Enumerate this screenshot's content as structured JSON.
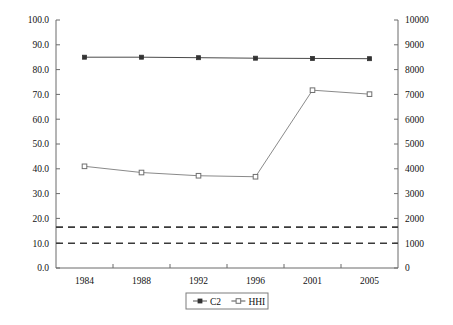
{
  "chart_data": {
    "type": "line",
    "title": "",
    "xlabel": "",
    "ylabel": "",
    "y2label": "",
    "categories": [
      "1984",
      "1988",
      "1992",
      "1996",
      "2001",
      "2005"
    ],
    "x": [
      1984,
      1988,
      1992,
      1996,
      2001,
      2005
    ],
    "ylim": [
      0.0,
      100.0
    ],
    "y2lim": [
      0,
      10000
    ],
    "ytick_labels": [
      "0.0",
      "10.0",
      "20.0",
      "30.0",
      "40.0",
      "50.0",
      "60.0",
      "70.0",
      "80.0",
      "90.0",
      "100.0"
    ],
    "ytick_values": [
      0.0,
      10.0,
      20.0,
      30.0,
      40.0,
      50.0,
      60.0,
      70.0,
      80.0,
      90.0,
      100.0
    ],
    "y2tick_labels": [
      "0",
      "1000",
      "2000",
      "3000",
      "4000",
      "5000",
      "6000",
      "7000",
      "8000",
      "9000",
      "10000"
    ],
    "y2tick_values": [
      0,
      1000,
      2000,
      3000,
      4000,
      5000,
      6000,
      7000,
      8000,
      9000,
      10000
    ],
    "grid": false,
    "legend_position": "bottom",
    "series": [
      {
        "name": "C2",
        "axis": "left",
        "marker": "filled-diamond",
        "color": "#4a4a4a",
        "values": [
          85.0,
          85.0,
          84.8,
          84.6,
          84.5,
          84.4
        ]
      },
      {
        "name": "HHI",
        "axis": "right",
        "marker": "open-square",
        "color": "#8a8a8a",
        "values": [
          41.0,
          38.5,
          37.2,
          36.8,
          71.7,
          70.1
        ],
        "values_right_axis": [
          4100,
          3850,
          3720,
          3680,
          7170,
          7010
        ]
      }
    ],
    "reference_lines": [
      {
        "name": "hhi-upper-threshold",
        "value": 16.5,
        "value_right_axis": 1650,
        "style": "dashed",
        "color": "#3a3a3a"
      },
      {
        "name": "hhi-lower-threshold",
        "value": 10.0,
        "value_right_axis": 1000,
        "style": "dashed",
        "color": "#3a3a3a"
      }
    ],
    "legend": [
      {
        "label": "C2",
        "marker": "filled-diamond"
      },
      {
        "label": "HHI",
        "marker": "open-square"
      }
    ]
  },
  "colors": {
    "background": "#ffffff",
    "axis": "#6b6b6b",
    "text": "#111111",
    "series_c2": "#4a4a4a",
    "series_hhi": "#8a8a8a",
    "reference_line": "#3a3a3a"
  }
}
